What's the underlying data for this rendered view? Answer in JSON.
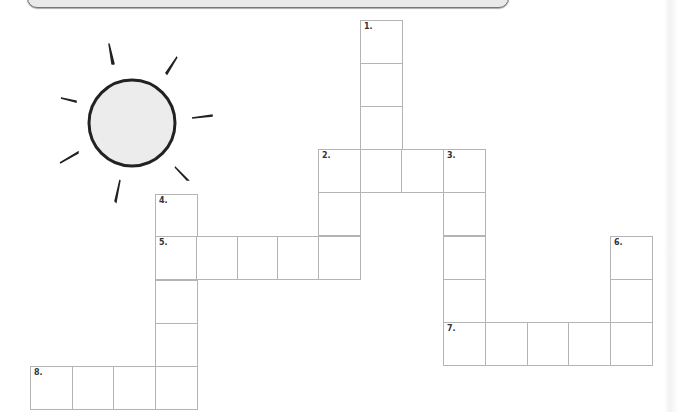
{
  "header_bar": {
    "label": ""
  },
  "sun": {
    "icon": "sun-icon",
    "fill": "#ececec",
    "stroke": "#222222"
  },
  "grid": {
    "line_color": "#b4b4b4",
    "clue_numbers": [
      "1.",
      "2.",
      "3.",
      "4.",
      "5.",
      "6.",
      "7.",
      "8."
    ],
    "cells": [
      {
        "x": 360,
        "y": 20,
        "label": "1."
      },
      {
        "x": 360,
        "y": 63,
        "label": ""
      },
      {
        "x": 360,
        "y": 106,
        "label": ""
      },
      {
        "x": 318,
        "y": 149,
        "label": "2."
      },
      {
        "x": 360,
        "y": 149,
        "label": ""
      },
      {
        "x": 401,
        "y": 149,
        "label": ""
      },
      {
        "x": 443,
        "y": 149,
        "label": "3."
      },
      {
        "x": 318,
        "y": 192,
        "label": ""
      },
      {
        "x": 443,
        "y": 192,
        "label": ""
      },
      {
        "x": 155,
        "y": 194,
        "label": "4."
      },
      {
        "x": 155,
        "y": 236,
        "label": "5."
      },
      {
        "x": 196,
        "y": 236,
        "label": ""
      },
      {
        "x": 237,
        "y": 236,
        "label": ""
      },
      {
        "x": 277,
        "y": 236,
        "label": ""
      },
      {
        "x": 318,
        "y": 236,
        "label": ""
      },
      {
        "x": 443,
        "y": 236,
        "label": ""
      },
      {
        "x": 610,
        "y": 236,
        "label": "6."
      },
      {
        "x": 155,
        "y": 280,
        "label": ""
      },
      {
        "x": 443,
        "y": 279,
        "label": ""
      },
      {
        "x": 610,
        "y": 279,
        "label": ""
      },
      {
        "x": 155,
        "y": 323,
        "label": ""
      },
      {
        "x": 443,
        "y": 322,
        "label": "7."
      },
      {
        "x": 485,
        "y": 322,
        "label": ""
      },
      {
        "x": 527,
        "y": 322,
        "label": ""
      },
      {
        "x": 568,
        "y": 322,
        "label": ""
      },
      {
        "x": 610,
        "y": 322,
        "label": ""
      },
      {
        "x": 30,
        "y": 366,
        "label": "8."
      },
      {
        "x": 72,
        "y": 366,
        "label": ""
      },
      {
        "x": 113,
        "y": 366,
        "label": ""
      },
      {
        "x": 155,
        "y": 366,
        "label": ""
      }
    ]
  }
}
